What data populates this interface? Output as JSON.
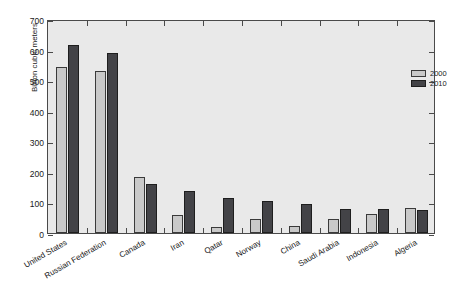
{
  "chart_data": {
    "type": "bar",
    "title": "",
    "subtitle": "",
    "xlabel": "",
    "ylabel": "Billion cubic meters",
    "ylim": [
      0,
      700
    ],
    "yticks": [
      0,
      100,
      200,
      300,
      400,
      500,
      600,
      700
    ],
    "ytick_labels": [
      "0",
      "100",
      "200",
      "300",
      "400",
      "500",
      "600",
      "700"
    ],
    "grid": false,
    "legend_position": "top-right",
    "categories": [
      "United States",
      "Russian Federation",
      "Canada",
      "Iran",
      "Qatar",
      "Norway",
      "China",
      "Saudi Arabia",
      "Indonesia",
      "Algeria"
    ],
    "series": [
      {
        "name": "2000",
        "color": "#c9c9c9",
        "values": [
          543,
          530,
          182,
          60,
          21,
          47,
          23,
          47,
          61,
          81
        ]
      },
      {
        "name": "2010",
        "color": "#434347",
        "values": [
          615,
          588,
          159,
          138,
          116,
          106,
          94,
          80,
          77,
          76
        ]
      }
    ]
  },
  "legend": {
    "items": [
      {
        "label": "2000"
      },
      {
        "label": "2010"
      }
    ]
  },
  "axis": {
    "y_label": "Billion cubic meters"
  },
  "colors": {
    "series_2000": "#c9c9c9",
    "series_2010": "#434347",
    "plot_background": "#e9e9e9",
    "axis_line": "#4a4a4a",
    "figure_background": "#ffffff"
  }
}
